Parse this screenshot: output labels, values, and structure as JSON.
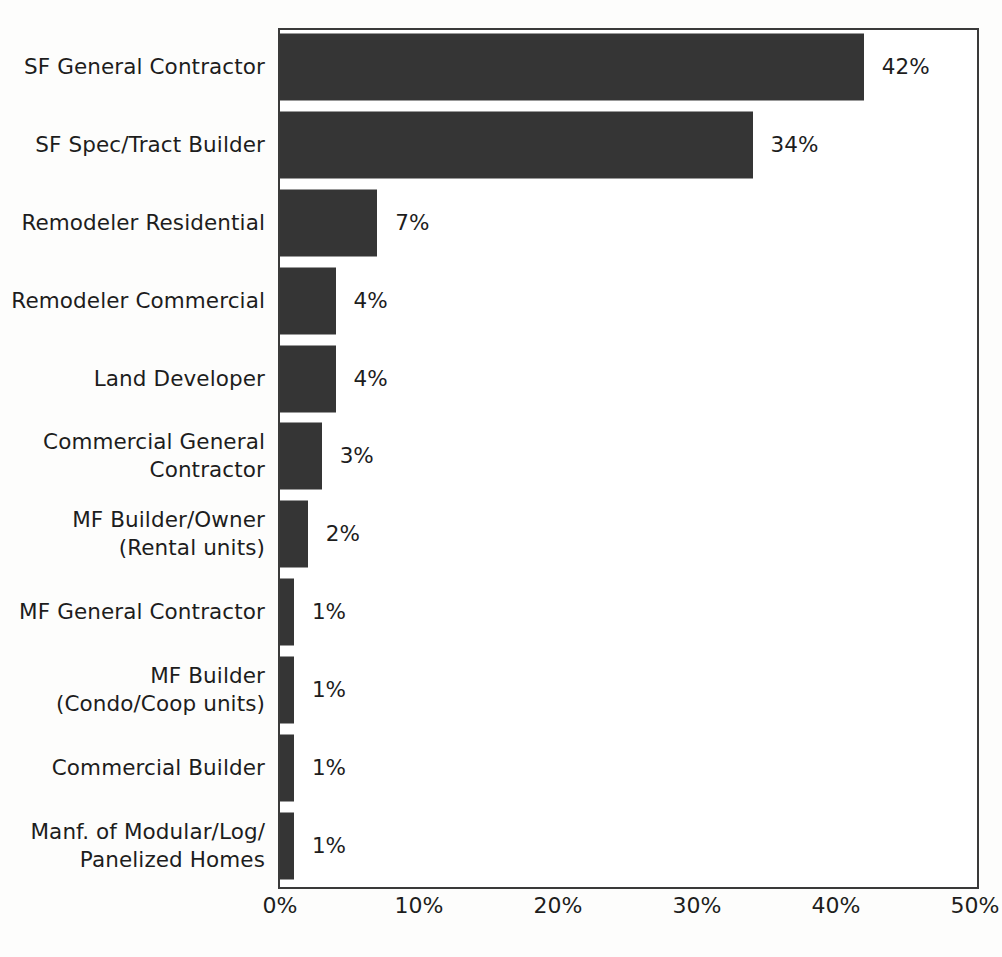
{
  "chart_data": {
    "type": "bar",
    "orientation": "horizontal",
    "title": "",
    "subtitle": "",
    "xlabel": "",
    "ylabel": "",
    "xlim": [
      0,
      50
    ],
    "xticks": [
      "0%",
      "10%",
      "20%",
      "30%",
      "40%",
      "50%"
    ],
    "xtick_values": [
      0,
      10,
      20,
      30,
      40,
      50
    ],
    "grid": false,
    "legend": false,
    "bar_color": "#353535",
    "frame_color": "#3a3a3a",
    "text_color": "#1d1d1d",
    "background": "#ffffff",
    "categories": [
      "SF General Contractor",
      "SF Spec/Tract Builder",
      "Remodeler Residential",
      "Remodeler Commercial",
      "Land Developer",
      "Commercial General\nContractor",
      "MF Builder/Owner\n(Rental units)",
      "MF General Contractor",
      "MF Builder\n(Condo/Coop units)",
      "Commercial Builder",
      "Manf. of Modular/Log/\nPanelized Homes"
    ],
    "values": [
      42,
      34,
      7,
      4,
      4,
      3,
      2,
      1,
      1,
      1,
      1
    ],
    "data_labels": [
      "42%",
      "34%",
      "7%",
      "4%",
      "4%",
      "3%",
      "2%",
      "1%",
      "1%",
      "1%",
      "1%"
    ]
  }
}
